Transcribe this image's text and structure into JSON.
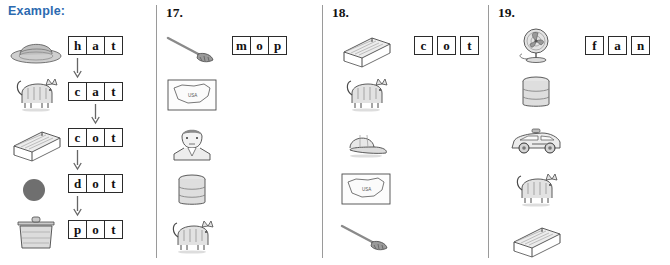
{
  "page": {
    "example_label": "Example:",
    "background": "#ffffff",
    "accent_color": "#2c6ab0",
    "ink_color": "#2b2b2b"
  },
  "columns": [
    {
      "id": "example",
      "heading": "Example:",
      "heading_kind": "label",
      "pictures": [
        {
          "name": "hat",
          "icon": "hat-icon"
        },
        {
          "name": "cat",
          "icon": "cat-icon"
        },
        {
          "name": "cot",
          "icon": "cot-icon"
        },
        {
          "name": "dot",
          "icon": "dot-icon"
        },
        {
          "name": "pot",
          "icon": "pot-icon"
        }
      ],
      "words": [
        {
          "letters": [
            "h",
            "a",
            "t"
          ],
          "filled": true
        },
        {
          "letters": [
            "c",
            "a",
            "t"
          ],
          "filled": true
        },
        {
          "letters": [
            "c",
            "o",
            "t"
          ],
          "filled": true
        },
        {
          "letters": [
            "d",
            "o",
            "t"
          ],
          "filled": true
        },
        {
          "letters": [
            "p",
            "o",
            "t"
          ],
          "filled": true
        }
      ],
      "arrows": [
        {
          "from_word": 0,
          "to_word": 1,
          "letter_index": 0
        },
        {
          "from_word": 1,
          "to_word": 2,
          "letter_index": 1
        },
        {
          "from_word": 2,
          "to_word": 3,
          "letter_index": 0
        },
        {
          "from_word": 3,
          "to_word": 4,
          "letter_index": 0
        }
      ]
    },
    {
      "id": "q17",
      "heading": "17.",
      "heading_kind": "number",
      "pictures": [
        {
          "name": "mop",
          "icon": "mop-icon"
        },
        {
          "name": "map",
          "icon": "map-icon"
        },
        {
          "name": "man",
          "icon": "man-icon"
        },
        {
          "name": "can",
          "icon": "can-icon"
        },
        {
          "name": "cat",
          "icon": "cat-icon"
        }
      ],
      "words": [
        {
          "letters": [
            "m",
            "o",
            "p"
          ],
          "filled": true
        },
        {
          "letters": [
            "",
            "",
            ""
          ],
          "filled": false
        },
        {
          "letters": [
            "",
            "",
            ""
          ],
          "filled": false
        },
        {
          "letters": [
            "",
            "",
            ""
          ],
          "filled": false
        },
        {
          "letters": [
            "",
            "",
            ""
          ],
          "filled": false
        }
      ],
      "arrows": []
    },
    {
      "id": "q18",
      "heading": "18.",
      "heading_kind": "number",
      "pictures": [
        {
          "name": "cot",
          "icon": "cot-icon"
        },
        {
          "name": "cat",
          "icon": "cat-icon"
        },
        {
          "name": "cap",
          "icon": "cap-icon"
        },
        {
          "name": "map",
          "icon": "map-icon"
        },
        {
          "name": "mop",
          "icon": "mop-icon"
        }
      ],
      "words": [
        {
          "letters": [
            "c",
            "o",
            "t"
          ],
          "filled": true
        },
        {
          "letters": [
            "",
            "",
            ""
          ],
          "filled": false
        },
        {
          "letters": [
            "",
            "",
            ""
          ],
          "filled": false
        },
        {
          "letters": [
            "",
            "",
            ""
          ],
          "filled": false
        },
        {
          "letters": [
            "",
            "",
            ""
          ],
          "filled": false
        }
      ],
      "arrows": []
    },
    {
      "id": "q19",
      "heading": "19.",
      "heading_kind": "number",
      "pictures": [
        {
          "name": "fan",
          "icon": "fan-icon"
        },
        {
          "name": "can",
          "icon": "can-icon"
        },
        {
          "name": "car",
          "icon": "car-icon"
        },
        {
          "name": "cat",
          "icon": "cat-icon"
        },
        {
          "name": "cot",
          "icon": "cot-icon"
        }
      ],
      "words": [
        {
          "letters": [
            "f",
            "a",
            "n"
          ],
          "filled": true
        },
        {
          "letters": [
            "",
            "",
            ""
          ],
          "filled": false
        },
        {
          "letters": [
            "",
            "",
            ""
          ],
          "filled": false
        },
        {
          "letters": [
            "",
            "",
            ""
          ],
          "filled": false
        },
        {
          "letters": [
            "",
            "",
            ""
          ],
          "filled": false
        }
      ],
      "arrows": []
    }
  ],
  "map_caption": "USA"
}
